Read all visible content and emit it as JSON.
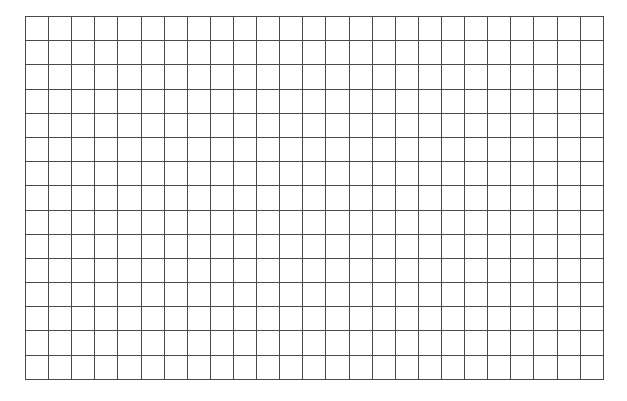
{
  "grid": {
    "columns": 25,
    "rows": 15,
    "line_color": "#4a4a4a",
    "background_color": "#ffffff",
    "cells": []
  }
}
